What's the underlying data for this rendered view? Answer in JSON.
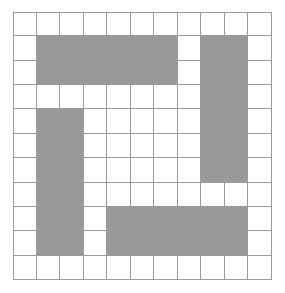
{
  "figure": {
    "name": "shaded-square-grid",
    "type": "grid-pattern",
    "rows": 11,
    "columns": 11,
    "cell_width_px": 23.5,
    "cell_height_px": 24.4,
    "grid_origin_x_px": 13,
    "grid_origin_y_px": 12,
    "grid_width_px": 259,
    "grid_height_px": 268,
    "background_color": "#ffffff",
    "grid_line_color": "#9a9a9a",
    "filled_cell_color": "#999999",
    "empty_cell_color": "#ffffff",
    "filled_cell_count": 48,
    "empty_cell_count": 73
  },
  "chart_data": {
    "type": "heatmap",
    "title": "",
    "xlabel": "",
    "ylabel": "",
    "legend": [],
    "grid": true,
    "row_labels": [
      "0",
      "1",
      "2",
      "3",
      "4",
      "5",
      "6",
      "7",
      "8",
      "9",
      "10"
    ],
    "column_labels": [
      "0",
      "1",
      "2",
      "3",
      "4",
      "5",
      "6",
      "7",
      "8",
      "9",
      "10"
    ],
    "value_legend": {
      "0": "empty",
      "1": "shaded"
    },
    "matrix": [
      [
        0,
        0,
        0,
        0,
        0,
        0,
        0,
        0,
        0,
        0,
        0
      ],
      [
        0,
        1,
        1,
        1,
        1,
        1,
        1,
        0,
        1,
        1,
        0
      ],
      [
        0,
        1,
        1,
        1,
        1,
        1,
        1,
        0,
        1,
        1,
        0
      ],
      [
        0,
        0,
        0,
        0,
        0,
        0,
        0,
        0,
        1,
        1,
        0
      ],
      [
        0,
        1,
        1,
        0,
        0,
        0,
        0,
        0,
        1,
        1,
        0
      ],
      [
        0,
        1,
        1,
        0,
        0,
        0,
        0,
        0,
        1,
        1,
        0
      ],
      [
        0,
        1,
        1,
        0,
        0,
        0,
        0,
        0,
        1,
        1,
        0
      ],
      [
        0,
        1,
        1,
        0,
        0,
        0,
        0,
        0,
        0,
        0,
        0
      ],
      [
        0,
        1,
        1,
        0,
        1,
        1,
        1,
        1,
        1,
        1,
        0
      ],
      [
        0,
        1,
        1,
        0,
        1,
        1,
        1,
        1,
        1,
        1,
        0
      ],
      [
        0,
        0,
        0,
        0,
        0,
        0,
        0,
        0,
        0,
        0,
        0
      ]
    ]
  }
}
